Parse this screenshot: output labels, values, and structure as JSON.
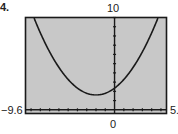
{
  "problem_label": "4.",
  "colors": {
    "screen_bg": "#c8c8c8",
    "curve": "#1a1a1a",
    "frame": "#1a1a1a",
    "axis": "#1a1a1a"
  },
  "labels": {
    "ymax": "10",
    "xmin": "−9.6",
    "xmax": "5.",
    "xzero": "0"
  },
  "chart_data": {
    "type": "line",
    "title": "",
    "xlabel": "",
    "ylabel": "",
    "window": {
      "xmin": -9.6,
      "xmax": 5.6,
      "ymin": -0.4,
      "ymax": 10
    },
    "tick_labels": {
      "x_left": "-9.6",
      "x_right": "5.",
      "x_origin": "0",
      "y_top": "10"
    },
    "grid": false,
    "axes": {
      "x_axis_at_y": 0,
      "y_axis_at_x": 0,
      "tick_spacing_x": 1,
      "tick_spacing_y": 1
    },
    "series": [
      {
        "name": "parabola",
        "description": "upward-opening parabola, vertex near (-2, 1.6)",
        "vertex": [
          -2,
          1.6
        ],
        "x": [
          -8.7,
          -8,
          -7,
          -6,
          -5,
          -4,
          -3,
          -2,
          -1,
          0,
          1,
          2,
          3,
          4,
          4.7
        ],
        "y": [
          10.0,
          8.44,
          6.35,
          4.64,
          3.31,
          2.36,
          1.79,
          1.6,
          1.79,
          2.36,
          3.31,
          4.64,
          6.35,
          8.44,
          10.0
        ]
      }
    ],
    "legend": null
  }
}
